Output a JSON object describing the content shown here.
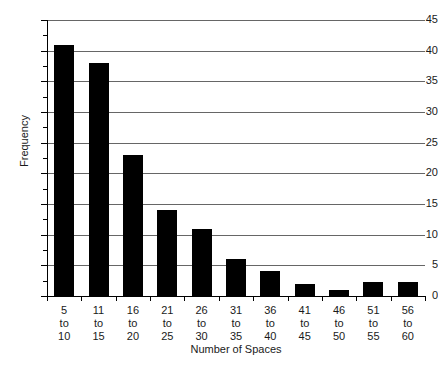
{
  "chart_data": {
    "type": "bar",
    "title": "",
    "xlabel": "Number of Spaces",
    "ylabel": "Frequency",
    "categories": [
      "5 to 10",
      "11 to 15",
      "16 to 20",
      "21 to 25",
      "26 to 30",
      "31 to 35",
      "36 to 40",
      "41 to 45",
      "46 to 50",
      "51 to 55",
      "56 to 60"
    ],
    "category_lines": [
      [
        "5",
        "to",
        "10"
      ],
      [
        "11",
        "to",
        "15"
      ],
      [
        "16",
        "to",
        "20"
      ],
      [
        "21",
        "to",
        "25"
      ],
      [
        "26",
        "to",
        "30"
      ],
      [
        "31",
        "to",
        "35"
      ],
      [
        "36",
        "to",
        "40"
      ],
      [
        "41",
        "to",
        "45"
      ],
      [
        "46",
        "to",
        "50"
      ],
      [
        "51",
        "to",
        "55"
      ],
      [
        "56",
        "to",
        "60"
      ]
    ],
    "values": [
      41,
      38,
      23,
      14,
      11,
      6,
      4,
      2,
      1,
      2.3,
      2.3
    ],
    "ylim": [
      0,
      45
    ],
    "ytick_labels": [
      "0",
      "5",
      "10",
      "15",
      "20",
      "25",
      "30",
      "35",
      "40",
      "45"
    ],
    "ytick_values": [
      0,
      5,
      10,
      15,
      20,
      25,
      30,
      35,
      40,
      45
    ],
    "yminor_interval": 2.5,
    "grid": true,
    "grid_axis": "y",
    "legend": false,
    "bar_color": "#000000",
    "grid_color": "#666666",
    "axis_color": "#000000"
  }
}
